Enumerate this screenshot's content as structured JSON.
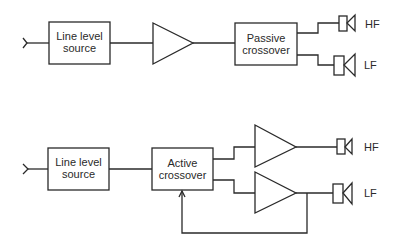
{
  "diagram": {
    "passive_system": {
      "source_label": "Line level source",
      "source_line1": "Line level",
      "source_line2": "source",
      "crossover_line1": "Passive",
      "crossover_line2": "crossover",
      "hf_label": "HF",
      "lf_label": "LF"
    },
    "active_system": {
      "source_line1": "Line level",
      "source_line2": "source",
      "crossover_line1": "Active",
      "crossover_line2": "crossover",
      "hf_label": "HF",
      "lf_label": "LF"
    },
    "colors": {
      "stroke": "#2a2a2a",
      "background": "#ffffff"
    }
  }
}
